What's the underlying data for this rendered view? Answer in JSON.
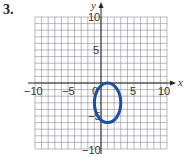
{
  "problem": {
    "number": "3."
  },
  "chart_data": {
    "type": "line",
    "title": "",
    "xlabel": "x",
    "ylabel": "y",
    "xlim": [
      -10,
      10
    ],
    "ylim": [
      -10,
      10
    ],
    "grid": true,
    "grid_step": 1,
    "x_tick_labels": [
      "-10",
      "-5",
      "0",
      "5",
      "10"
    ],
    "y_tick_labels": [
      "10",
      "5",
      "-5",
      "-10"
    ],
    "curve": {
      "shape": "ellipse",
      "center": [
        1,
        -3
      ],
      "semi_axis_x": 2,
      "semi_axis_y": 3,
      "color": "#1f4ea3"
    }
  },
  "labels": {
    "x_axis": "x",
    "y_axis": "y",
    "x_neg10": "−10",
    "x_neg5": "−5",
    "x_0": "0",
    "x_5": "5",
    "x_10": "10",
    "y_10": "10",
    "y_5": "5",
    "y_neg5": "−5",
    "y_neg10": "−10"
  }
}
